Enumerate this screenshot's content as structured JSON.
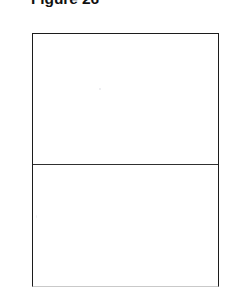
{
  "document": {
    "type": "scanned-figure-page",
    "background_color": "#ffffff"
  },
  "figure": {
    "title": "Figure 26",
    "title_clipped_at_top": true,
    "border_color": "#1c1c1c",
    "faded_border_color": "#c9c9c9",
    "divider_color": "#303030",
    "cells": [
      {
        "name": "upper-cell",
        "content": ""
      },
      {
        "name": "lower-cell",
        "content": ""
      }
    ]
  }
}
